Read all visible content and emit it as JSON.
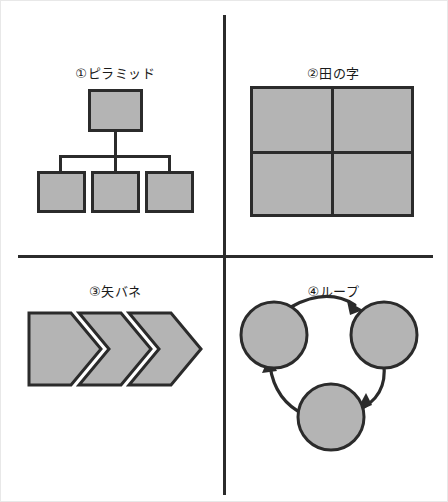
{
  "page": {
    "background_color": "#ffffff",
    "line_color": "#2b2b2b",
    "shape_fill_color": "#b4b4b4"
  },
  "quadrants": [
    {
      "id": "q1",
      "number": "①",
      "label": "①ピラミッド",
      "name_romaji": "pyramid",
      "figure_type": "org-chart",
      "node_count": 4
    },
    {
      "id": "q2",
      "number": "②",
      "label": "②田の字",
      "name_romaji": "ta-no-ji",
      "figure_type": "2x2-grid",
      "node_count": 4
    },
    {
      "id": "q3",
      "number": "③",
      "label": "③矢バネ",
      "name_romaji": "ya-bane",
      "figure_type": "chevron-process",
      "node_count": 3
    },
    {
      "id": "q4",
      "number": "④",
      "label": "④ループ",
      "name_romaji": "loop",
      "figure_type": "cycle",
      "node_count": 3
    }
  ]
}
